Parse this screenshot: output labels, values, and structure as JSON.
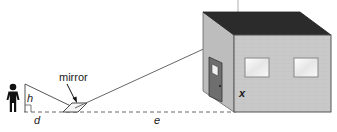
{
  "labels": {
    "mirror": "mirror",
    "h": "h",
    "d": "d",
    "e": "e",
    "x": "x"
  },
  "icons": {
    "person": "person-icon",
    "arrow": "arrow-icon"
  },
  "colors": {
    "roof": "#2b2b2b",
    "front_wall": "#c9c9c9",
    "side_wall": "#bdbdbd",
    "door": "#6e6e6e",
    "window": "#ececec",
    "line": "#555555",
    "dashed": "#666666",
    "text": "#1a1a1a"
  }
}
